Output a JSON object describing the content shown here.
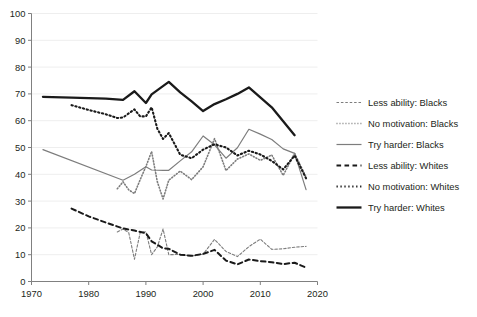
{
  "chart_data": {
    "type": "line",
    "title": "",
    "subtitle": "",
    "xlabel": "",
    "ylabel": "",
    "xlim": [
      1970,
      2020
    ],
    "ylim": [
      0,
      100
    ],
    "xticks": [
      1970,
      1980,
      1990,
      2000,
      2010,
      2020
    ],
    "yticks": [
      0,
      10,
      20,
      30,
      40,
      50,
      60,
      70,
      80,
      90,
      100
    ],
    "grid": "horizontal",
    "legend_position": "right",
    "colors": {
      "blacks": "#7d7d7d",
      "whites": "#1a1a1a",
      "gridline": "#eeeeee",
      "axis": "#808080",
      "text": "#231f20",
      "background": "#ffffff"
    },
    "series": [
      {
        "name": "Less ability: Blacks",
        "group": "Blacks",
        "measure": "Less ability",
        "style": "dashed",
        "color": "#7d7d7d",
        "width": 1.1,
        "points": [
          [
            1985,
            18.5
          ],
          [
            1986,
            19.6
          ],
          [
            1987,
            18.2
          ],
          [
            1988,
            8.3
          ],
          [
            1989,
            18.2
          ],
          [
            1990,
            18.6
          ],
          [
            1991,
            10.0
          ],
          [
            1992,
            12.9
          ],
          [
            1993,
            19.6
          ],
          [
            1994,
            10.0
          ],
          [
            1996,
            10.1
          ],
          [
            1998,
            9.5
          ],
          [
            2000,
            10.2
          ],
          [
            2002,
            15.7
          ],
          [
            2004,
            11.2
          ],
          [
            2006,
            9.3
          ],
          [
            2008,
            13.0
          ],
          [
            2010,
            15.8
          ],
          [
            2012,
            12.0
          ],
          [
            2014,
            12.2
          ],
          [
            2016,
            12.8
          ],
          [
            2018,
            13.1
          ]
        ]
      },
      {
        "name": "No motivation: Blacks",
        "group": "Blacks",
        "measure": "No motivation",
        "style": "dotted",
        "color": "#7d7d7d",
        "width": 1.6,
        "points": [
          [
            1985,
            34.6
          ],
          [
            1986,
            37.2
          ],
          [
            1987,
            34.2
          ],
          [
            1988,
            32.8
          ],
          [
            1989,
            38.0
          ],
          [
            1990,
            42.9
          ],
          [
            1991,
            48.5
          ],
          [
            1992,
            37.2
          ],
          [
            1993,
            30.8
          ],
          [
            1994,
            37.8
          ],
          [
            1996,
            41.2
          ],
          [
            1998,
            38.0
          ],
          [
            2000,
            42.8
          ],
          [
            2002,
            53.3
          ],
          [
            2004,
            41.4
          ],
          [
            2006,
            45.7
          ],
          [
            2008,
            47.6
          ],
          [
            2010,
            45.2
          ],
          [
            2012,
            47.2
          ],
          [
            2014,
            39.6
          ],
          [
            2016,
            47.8
          ],
          [
            2018,
            39.0
          ]
        ]
      },
      {
        "name": "Try harder: Blacks",
        "group": "Blacks",
        "measure": "Try harder",
        "style": "solid",
        "color": "#7d7d7d",
        "width": 1.2,
        "points": [
          [
            1972,
            49.2
          ],
          [
            1986,
            37.8
          ],
          [
            1988,
            40.0
          ],
          [
            1990,
            42.8
          ],
          [
            1991,
            41.6
          ],
          [
            1993,
            41.5
          ],
          [
            1994,
            41.5
          ],
          [
            1996,
            45.0
          ],
          [
            1998,
            48.4
          ],
          [
            2000,
            54.3
          ],
          [
            2002,
            51.0
          ],
          [
            2004,
            46.0
          ],
          [
            2006,
            49.9
          ],
          [
            2008,
            56.8
          ],
          [
            2010,
            55.0
          ],
          [
            2012,
            53.0
          ],
          [
            2014,
            49.5
          ],
          [
            2016,
            47.8
          ],
          [
            2018,
            34.3
          ]
        ]
      },
      {
        "name": "Less ability: Whites",
        "group": "Whites",
        "measure": "Less ability",
        "style": "dashed",
        "color": "#1a1a1a",
        "width": 2.0,
        "points": [
          [
            1977,
            27.2
          ],
          [
            1980,
            24.3
          ],
          [
            1983,
            22.0
          ],
          [
            1986,
            19.8
          ],
          [
            1988,
            19.0
          ],
          [
            1990,
            18.0
          ],
          [
            1991,
            15.0
          ],
          [
            1993,
            12.4
          ],
          [
            1994,
            12.2
          ],
          [
            1996,
            10.0
          ],
          [
            1998,
            9.6
          ],
          [
            2000,
            10.3
          ],
          [
            2002,
            11.8
          ],
          [
            2004,
            7.8
          ],
          [
            2006,
            6.4
          ],
          [
            2008,
            8.2
          ],
          [
            2010,
            7.6
          ],
          [
            2012,
            7.2
          ],
          [
            2014,
            6.5
          ],
          [
            2016,
            7.0
          ],
          [
            2018,
            5.2
          ]
        ]
      },
      {
        "name": "No motivation: Whites",
        "group": "Whites",
        "measure": "No motivation",
        "style": "dotted",
        "color": "#1a1a1a",
        "width": 2.1,
        "points": [
          [
            1977,
            65.8
          ],
          [
            1980,
            64.0
          ],
          [
            1983,
            62.4
          ],
          [
            1985,
            61.0
          ],
          [
            1986,
            61.2
          ],
          [
            1988,
            64.2
          ],
          [
            1989,
            61.6
          ],
          [
            1990,
            61.6
          ],
          [
            1991,
            65.0
          ],
          [
            1992,
            57.0
          ],
          [
            1993,
            53.2
          ],
          [
            1994,
            55.4
          ],
          [
            1996,
            47.3
          ],
          [
            1998,
            46.0
          ],
          [
            2000,
            49.2
          ],
          [
            2002,
            51.2
          ],
          [
            2004,
            50.0
          ],
          [
            2006,
            47.0
          ],
          [
            2008,
            48.8
          ],
          [
            2010,
            47.4
          ],
          [
            2012,
            45.0
          ],
          [
            2014,
            41.8
          ],
          [
            2016,
            47.0
          ],
          [
            2018,
            38.5
          ]
        ]
      },
      {
        "name": "Try harder: Whites",
        "group": "Whites",
        "measure": "Try harder",
        "style": "solid",
        "color": "#1a1a1a",
        "width": 2.3,
        "points": [
          [
            1972,
            68.9
          ],
          [
            1977,
            68.6
          ],
          [
            1983,
            68.2
          ],
          [
            1986,
            67.8
          ],
          [
            1988,
            71.0
          ],
          [
            1990,
            66.6
          ],
          [
            1991,
            69.8
          ],
          [
            1994,
            74.5
          ],
          [
            1996,
            70.6
          ],
          [
            1998,
            67.2
          ],
          [
            2000,
            63.6
          ],
          [
            2002,
            66.2
          ],
          [
            2004,
            68.0
          ],
          [
            2006,
            70.0
          ],
          [
            2008,
            72.4
          ],
          [
            2012,
            65.0
          ],
          [
            2016,
            54.6
          ]
        ]
      }
    ]
  },
  "legend": {
    "items": [
      {
        "label": "Less ability: Blacks"
      },
      {
        "label": "No motivation: Blacks"
      },
      {
        "label": "Try harder: Blacks"
      },
      {
        "label": "Less ability: Whites"
      },
      {
        "label": "No motivation: Whites"
      },
      {
        "label": "Try harder: Whites"
      }
    ]
  }
}
